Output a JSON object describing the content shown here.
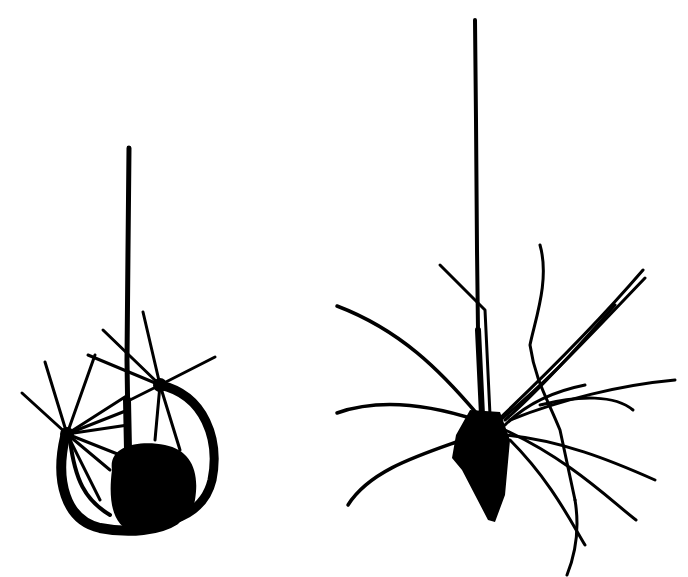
{
  "figure": {
    "background": "#ffffff",
    "ink": "#000000",
    "panels": [
      {
        "id": "left",
        "subject": "cell-with-curled-dendrites"
      },
      {
        "id": "right",
        "subject": "pyramidal-neuron"
      }
    ]
  }
}
